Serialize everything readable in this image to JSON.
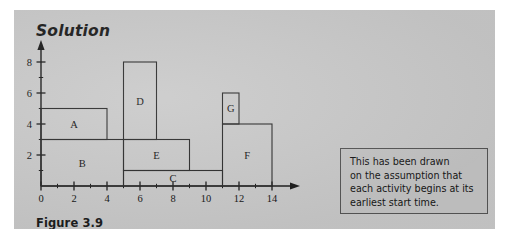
{
  "page": {
    "background_color": "#ffffff",
    "panel_color": "#c9c9c9"
  },
  "heading": {
    "text": "Solution"
  },
  "caption": {
    "text": "Figure 3.9"
  },
  "callout": {
    "text": "This has been drawn\non the assumption that\neach activity begins at its\nearliest start time.",
    "border_color": "#555555",
    "background_color": "#c4c4c4"
  },
  "chart_data": {
    "type": "bar",
    "title": "",
    "subtitle": "",
    "xlabel": "",
    "ylabel": "",
    "xlim": [
      0,
      14
    ],
    "ylim": [
      0,
      8
    ],
    "grid": false,
    "legend": "none",
    "orientation": "gantt-style cascade diagram",
    "xticks": [
      0,
      2,
      4,
      6,
      8,
      10,
      12,
      14
    ],
    "xtick_labels": [
      "0",
      "2",
      "4",
      "6",
      "8",
      "10",
      "12",
      "14"
    ],
    "x_minor_ticks": [
      1,
      3,
      5,
      7,
      9,
      11,
      13
    ],
    "yticks": [
      2,
      4,
      6,
      8
    ],
    "ytick_labels": [
      "2",
      "4",
      "6",
      "8"
    ],
    "y_minor_ticks": [
      1,
      3,
      5,
      7
    ],
    "categories": [
      "A",
      "B",
      "C",
      "D",
      "E",
      "F",
      "G"
    ],
    "blocks": [
      {
        "label": "A",
        "x_start": 0,
        "x_end": 4,
        "y_bottom": 3,
        "y_top": 5
      },
      {
        "label": "B",
        "x_start": 0,
        "x_end": 5,
        "y_bottom": 0,
        "y_top": 3
      },
      {
        "label": "C",
        "x_start": 5,
        "x_end": 11,
        "y_bottom": 0,
        "y_top": 1
      },
      {
        "label": "D",
        "x_start": 5,
        "x_end": 7,
        "y_bottom": 3,
        "y_top": 8
      },
      {
        "label": "E",
        "x_start": 5,
        "x_end": 9,
        "y_bottom": 1,
        "y_top": 3
      },
      {
        "label": "F",
        "x_start": 11,
        "x_end": 14,
        "y_bottom": 0,
        "y_top": 4
      },
      {
        "label": "G",
        "x_start": 11,
        "x_end": 12,
        "y_bottom": 4,
        "y_top": 6
      }
    ],
    "stroke_color": "#2a2a2a",
    "axis_color": "#1a1a1a"
  }
}
